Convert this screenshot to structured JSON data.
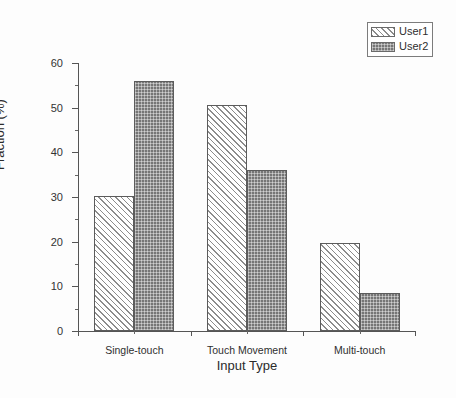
{
  "chart_data": {
    "type": "bar",
    "title": "",
    "xlabel": "Input Type",
    "ylabel": "Fraction (%)",
    "categories": [
      "Single-touch",
      "Touch Movement",
      "Multi-touch"
    ],
    "series": [
      {
        "name": "User1",
        "values": [
          30.3,
          50.7,
          19.6
        ],
        "fill": "diagonal-hatch",
        "color": "#ffffff"
      },
      {
        "name": "User2",
        "values": [
          56.0,
          36.1,
          8.6
        ],
        "fill": "dark-checker",
        "color": "#767676"
      }
    ],
    "ylim": [
      0,
      60
    ],
    "ytick_values": [
      0,
      10,
      20,
      30,
      40,
      50,
      60
    ],
    "ytick_labels": [
      "0",
      "10",
      "20",
      "30",
      "40",
      "50",
      "60"
    ],
    "yminor_values": [
      5,
      15,
      25,
      35,
      45,
      55
    ],
    "grid": false,
    "legend_position": "top-right",
    "legend_entries": [
      "User1",
      "User2"
    ]
  },
  "legend": {
    "items": [
      {
        "label": "User1"
      },
      {
        "label": "User2"
      }
    ]
  },
  "axes": {
    "y_title": "Fraction (%)",
    "x_title": "Input Type"
  }
}
